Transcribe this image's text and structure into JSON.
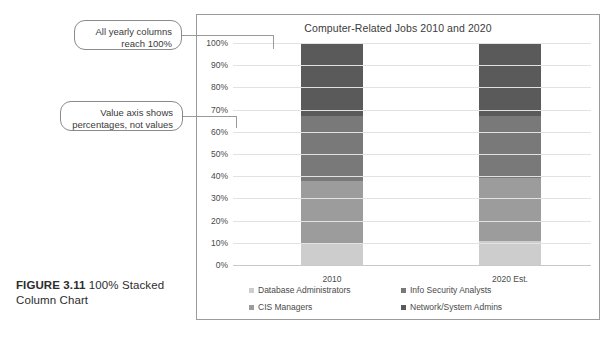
{
  "figure": {
    "label": "FIGURE 3.11",
    "caption": " 100% Stacked Column Chart"
  },
  "callouts": [
    {
      "id": "columns",
      "text": "All yearly columns reach 100%"
    },
    {
      "id": "axis",
      "text": "Value axis shows percentages, not values"
    }
  ],
  "chart_data": {
    "type": "bar",
    "stacked": true,
    "stacked_mode": "100%",
    "title": "Computer-Related Jobs 2010 and 2020",
    "xlabel": "",
    "ylabel": "",
    "ylim": [
      0,
      100
    ],
    "ytick_labels": [
      "100%",
      "90%",
      "80%",
      "70%",
      "60%",
      "50%",
      "40%",
      "30%",
      "20%",
      "10%",
      "0%"
    ],
    "ytick_values": [
      100,
      90,
      80,
      70,
      60,
      50,
      40,
      30,
      20,
      10,
      0
    ],
    "grid": true,
    "legend_position": "bottom",
    "categories": [
      "2010",
      "2020 Est."
    ],
    "series": [
      {
        "name": "Database Administrators",
        "color": "#cdcdcd",
        "values": [
          10,
          11
        ]
      },
      {
        "name": "CIS Managers",
        "color": "#9c9c9c",
        "values": [
          28,
          28
        ]
      },
      {
        "name": "Info Security Analysts",
        "color": "#797979",
        "values": [
          29,
          28
        ]
      },
      {
        "name": "Network/System Admins",
        "color": "#5a5a5a",
        "values": [
          33,
          33
        ]
      }
    ]
  }
}
